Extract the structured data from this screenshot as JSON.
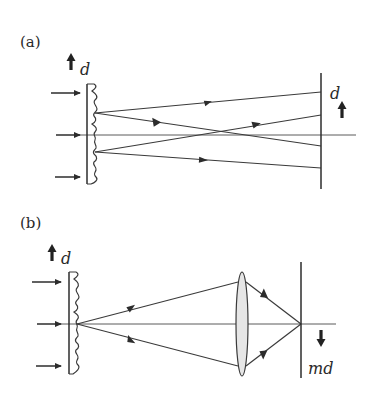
{
  "figure": {
    "panels": [
      {
        "id": "a",
        "label": "(a)",
        "description": "Talbot self-imaging: grating illuminated by plane wave, diffracted rays recombine at a plane a distance away producing image of period d",
        "grating_label": "d",
        "image_label": "d",
        "grating_arrow": "up",
        "image_arrow": "up"
      },
      {
        "id": "b",
        "label": "(b)",
        "description": "Grating imaged through a converging lens onto a screen; image period is md and inverted",
        "grating_label": "d",
        "image_label": "md",
        "grating_arrow": "up",
        "image_arrow": "down",
        "element": "lens"
      }
    ],
    "colors": {
      "line": "#3a3a3a",
      "lens_fill": "#e6e6e6",
      "background": "#ffffff"
    }
  }
}
